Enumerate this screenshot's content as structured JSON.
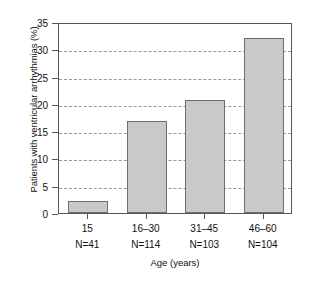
{
  "chart_data": {
    "type": "bar",
    "title": "",
    "xlabel": "Age (years)",
    "ylabel": "Patients with ventricular arrhythmias (%)",
    "categories": [
      "15",
      "16–30",
      "31–45",
      "46–60"
    ],
    "group_sizes": [
      "N=41",
      "N=114",
      "N=103",
      "N=104"
    ],
    "values": [
      2.2,
      16.9,
      20.8,
      32.0
    ],
    "ylim": [
      0,
      35
    ],
    "ytick_values": [
      0,
      5,
      10,
      15,
      20,
      25,
      30,
      35
    ],
    "ytick_labels": [
      "0",
      "5",
      "10",
      "15",
      "20",
      "25",
      "30",
      "35"
    ],
    "grid": "horizontal-dashed",
    "legend": "none",
    "bar_fill_color": "#c9c9c9",
    "bar_edge_color": "#6e6e6e",
    "axis_color": "#555555",
    "grid_color": "#999999"
  }
}
